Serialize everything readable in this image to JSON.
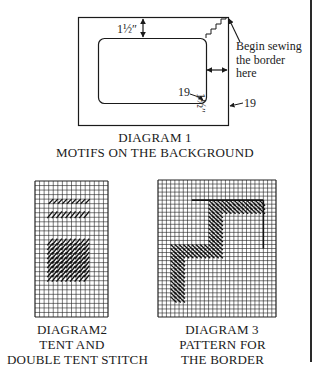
{
  "diagram1": {
    "measure_top": "1½″",
    "measure_right": "1½″",
    "note": [
      "Begin sewing",
      "the  border",
      "here"
    ],
    "inner_corner_label": "19",
    "outer_edge_label": "19",
    "caption": [
      "DIAGRAM 1",
      "MOTIFS ON THE BACKGROUND"
    ]
  },
  "diagram2": {
    "caption": [
      "DIAGRAM2",
      "TENT AND",
      "DOUBLE TENT STITCH"
    ],
    "grid": {
      "cols": 16,
      "rows": 30
    },
    "stitches": [
      {
        "name": "tent-stitch-row",
        "type": "single",
        "row": 4,
        "col_start": 3,
        "col_end": 11
      },
      {
        "name": "double-tent-row",
        "type": "double",
        "row": 7,
        "col_start": 3,
        "col_end": 11
      },
      {
        "name": "double-tent-block",
        "type": "double",
        "row_start": 13,
        "row_end": 21,
        "col_start": 3,
        "col_end": 11
      }
    ]
  },
  "diagram3": {
    "caption": [
      "DIAGRAM 3",
      "PATTERN FOR",
      "THE BORDER"
    ],
    "grid": {
      "cols": 28,
      "rows": 34
    },
    "border_line": "L-shaped outline at top-right corner",
    "pattern": "stepped diagonal-hatched zig-zag band"
  },
  "page": {
    "right_rule": true
  }
}
